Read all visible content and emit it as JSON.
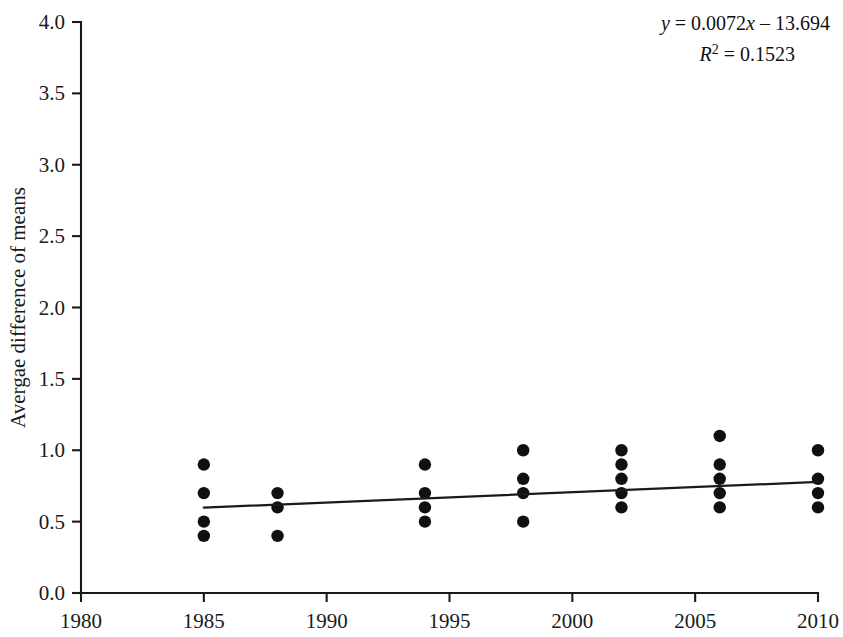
{
  "chart_data": {
    "type": "scatter",
    "title": "",
    "xlabel": "",
    "ylabel": "Avergae difference of means",
    "xlim": [
      1980,
      2010
    ],
    "ylim": [
      0.0,
      4.0
    ],
    "xticks": [
      1980,
      1985,
      1990,
      1995,
      2000,
      2005,
      2010
    ],
    "xtick_labels": [
      "1980",
      "1985",
      "1990",
      "1995",
      "2000",
      "2005",
      "2010"
    ],
    "yticks": [
      0.0,
      0.5,
      1.0,
      1.5,
      2.0,
      2.5,
      3.0,
      3.5,
      4.0
    ],
    "ytick_labels": [
      "0.0",
      "0.5",
      "1.0",
      "1.5",
      "2.0",
      "2.5",
      "3.0",
      "3.5",
      "4.0"
    ],
    "grid": false,
    "legend": null,
    "marker": {
      "shape": "circle",
      "color": "#101010",
      "size": 6.2
    },
    "points": [
      {
        "x": 1985,
        "y": 0.9
      },
      {
        "x": 1985,
        "y": 0.7
      },
      {
        "x": 1985,
        "y": 0.5
      },
      {
        "x": 1985,
        "y": 0.4
      },
      {
        "x": 1988,
        "y": 0.7
      },
      {
        "x": 1988,
        "y": 0.6
      },
      {
        "x": 1988,
        "y": 0.4
      },
      {
        "x": 1994,
        "y": 0.9
      },
      {
        "x": 1994,
        "y": 0.7
      },
      {
        "x": 1994,
        "y": 0.6
      },
      {
        "x": 1994,
        "y": 0.5
      },
      {
        "x": 1998,
        "y": 1.0
      },
      {
        "x": 1998,
        "y": 0.8
      },
      {
        "x": 1998,
        "y": 0.7
      },
      {
        "x": 1998,
        "y": 0.5
      },
      {
        "x": 2002,
        "y": 1.0
      },
      {
        "x": 2002,
        "y": 0.9
      },
      {
        "x": 2002,
        "y": 0.8
      },
      {
        "x": 2002,
        "y": 0.7
      },
      {
        "x": 2002,
        "y": 0.6
      },
      {
        "x": 2006,
        "y": 1.1
      },
      {
        "x": 2006,
        "y": 0.9
      },
      {
        "x": 2006,
        "y": 0.8
      },
      {
        "x": 2006,
        "y": 0.7
      },
      {
        "x": 2006,
        "y": 0.6
      },
      {
        "x": 2010,
        "y": 1.0
      },
      {
        "x": 2010,
        "y": 0.8
      },
      {
        "x": 2010,
        "y": 0.7
      },
      {
        "x": 2010,
        "y": 0.6
      }
    ],
    "trendline": {
      "type": "linear",
      "slope": 0.0072,
      "intercept": -13.694,
      "x_start": 1985,
      "x_end": 2010,
      "color": "#1a1a1a"
    }
  },
  "annotation": {
    "equation_lhs": "y",
    "equation_rhs": " = 0.0072",
    "equation_var": "x",
    "equation_tail": " – 13.694",
    "r2_lhs": "R",
    "r2_sup": "2",
    "r2_rhs": " = 0.1523"
  }
}
